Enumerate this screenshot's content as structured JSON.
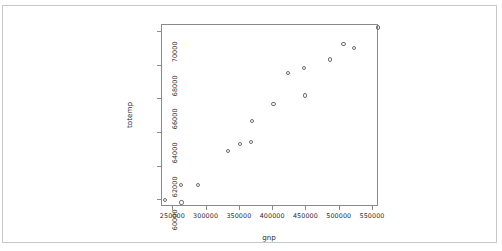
{
  "chart_data": {
    "type": "scatter",
    "title": "",
    "xlabel": "gnp",
    "ylabel": "totemp",
    "xlim": [
      230000,
      556000
    ],
    "ylim": [
      59900,
      70700
    ],
    "grid": false,
    "legend": null,
    "point_symbol": "open-circle",
    "xticks": [
      "250000",
      "300000",
      "350000",
      "400000",
      "450000",
      "500000",
      "550000"
    ],
    "xtick_values": [
      250000,
      300000,
      350000,
      400000,
      450000,
      500000,
      550000
    ],
    "yticks": [
      "60000",
      "62000",
      "64000",
      "66000",
      "68000",
      "70000"
    ],
    "ytick_values": [
      60000,
      62000,
      64000,
      66000,
      68000,
      70000
    ],
    "x": [
      234289,
      259426,
      258054,
      284599,
      328975,
      346999,
      365385,
      363112,
      397469,
      419180,
      442769,
      444546,
      482704,
      502601,
      518173,
      554894
    ],
    "y": [
      60323,
      60171,
      61187,
      61221,
      63221,
      63639,
      64989,
      63761,
      66019,
      67857,
      68169,
      66513,
      68655,
      69564,
      69331,
      70551
    ],
    "series": [
      {
        "name": "totemp vs gnp",
        "points": [
          {
            "x": 234289,
            "y": 60323
          },
          {
            "x": 259426,
            "y": 60171
          },
          {
            "x": 258054,
            "y": 61187
          },
          {
            "x": 284599,
            "y": 61221
          },
          {
            "x": 328975,
            "y": 63221
          },
          {
            "x": 346999,
            "y": 63639
          },
          {
            "x": 365385,
            "y": 64989
          },
          {
            "x": 363112,
            "y": 63761
          },
          {
            "x": 397469,
            "y": 66019
          },
          {
            "x": 419180,
            "y": 67857
          },
          {
            "x": 442769,
            "y": 68169
          },
          {
            "x": 444546,
            "y": 66513
          },
          {
            "x": 482704,
            "y": 68655
          },
          {
            "x": 502601,
            "y": 69564
          },
          {
            "x": 518173,
            "y": 69331
          },
          {
            "x": 554894,
            "y": 70551
          }
        ]
      }
    ],
    "n_points": 16,
    "colors": {
      "point_stroke": "#6e6e6e",
      "axis": "#8a8a8a",
      "text": "#2b2b2b",
      "background": "#ffffff",
      "frame": "#c8c8c8"
    }
  }
}
